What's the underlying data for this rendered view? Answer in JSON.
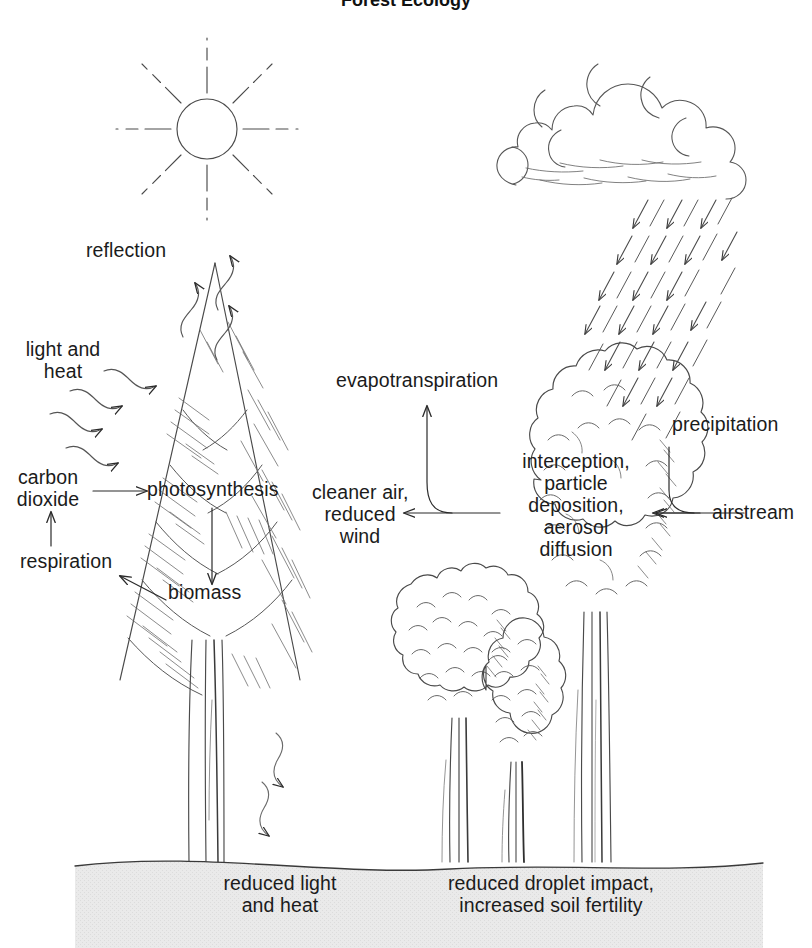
{
  "diagram": {
    "title": "Forest Ecology",
    "type": "forest ecosystem process diagram",
    "background_color": "#ffffff",
    "ink_color": "#3a3a3a",
    "ground_color": "#e9e9e9"
  },
  "labels": {
    "reflection": "reflection",
    "light_and_heat": "light and\nheat",
    "carbon_dioxide": "carbon\ndioxide",
    "respiration": "respiration",
    "photosynthesis": "photosynthesis",
    "biomass": "biomass",
    "evapotranspiration": "evapotranspiration",
    "cleaner_air": "cleaner air,\nreduced\nwind",
    "interception": "interception,\nparticle\ndeposition,\naerosol\ndiffusion",
    "precipitation": "precipitation",
    "airstream": "airstream",
    "reduced_light": "reduced light\nand heat",
    "reduced_droplet": "reduced droplet impact,\nincreased soil fertility"
  },
  "elements": {
    "sun": "sun-with-rays",
    "cloud": "rain-cloud",
    "rain": "rain-arrows",
    "conifer": "conifer-tree",
    "broadleaf_large": "large-broadleaf-tree",
    "broadleaf_medium": "medium-broadleaf-tree",
    "broadleaf_narrow": "narrow-broadleaf-tree",
    "ground": "ground-soil-band"
  }
}
